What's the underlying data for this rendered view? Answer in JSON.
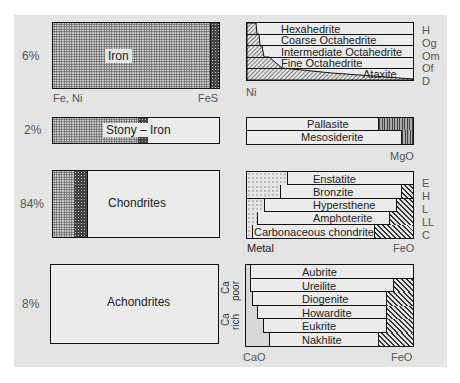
{
  "figure": {
    "groups": [
      {
        "id": "iron",
        "percent": "6%",
        "label": "Iron",
        "axis_left": "Fe, Ni",
        "axis_right": "FeS",
        "subtypes": {
          "axis_left": "Ni",
          "rows": [
            {
              "name": "Hexahedrite",
              "code": "H"
            },
            {
              "name": "Coarse Octahedrite",
              "code": "Og"
            },
            {
              "name": "Intermediate Octahedrite",
              "code": "Om"
            },
            {
              "name": "Fine Octahedrite",
              "code": "Of"
            },
            {
              "name": "Ataxite",
              "code": "D"
            }
          ]
        }
      },
      {
        "id": "stony-iron",
        "percent": "2%",
        "label": "Stony – Iron",
        "subtypes": {
          "axis_right": "MgO",
          "rows": [
            {
              "name": "Pallasite"
            },
            {
              "name": "Mesosiderite"
            }
          ]
        }
      },
      {
        "id": "chondrites",
        "percent": "84%",
        "label": "Chondrites",
        "subtypes": {
          "axis_left": "Metal",
          "axis_right": "FeO",
          "rows": [
            {
              "name": "Enstatite",
              "code": "E"
            },
            {
              "name": "Bronzite",
              "code": "H"
            },
            {
              "name": "Hypersthene",
              "code": "L"
            },
            {
              "name": "Amphoterite",
              "code": "LL"
            },
            {
              "name": "Carbonaceous chondrite",
              "code": "C"
            }
          ]
        }
      },
      {
        "id": "achondrites",
        "percent": "8%",
        "label": "Achondrites",
        "subtypes": {
          "axis_left": "CaO",
          "axis_right": "FeO",
          "side_labels": {
            "ca_poor": [
              "Ca",
              "poor"
            ],
            "ca_rich": [
              "Ca",
              "rich"
            ]
          },
          "rows": [
            {
              "name": "Aubrite"
            },
            {
              "name": "Ureilite"
            },
            {
              "name": "Diogenite"
            },
            {
              "name": "Howardite"
            },
            {
              "name": "Eukrite"
            },
            {
              "name": "Nakhlite"
            }
          ]
        }
      }
    ]
  }
}
